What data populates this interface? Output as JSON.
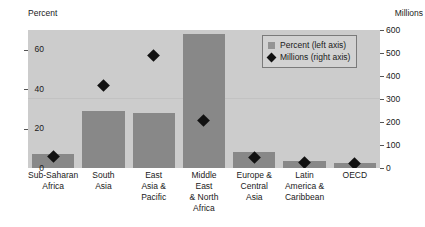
{
  "chart_data": {
    "type": "bar",
    "title": "",
    "subtitle": "",
    "categories": [
      "Sub-Saharan Africa",
      "South Asia",
      "East Asia & Pacific",
      "Middle East & North Africa",
      "Europe & Central Asia",
      "Latin America & Caribbean",
      "OECD"
    ],
    "category_lines": [
      [
        "Sub-Saharan",
        "Africa"
      ],
      [
        "South",
        "Asia"
      ],
      [
        "East",
        "Asia &",
        "Pacific"
      ],
      [
        "Middle",
        "East",
        "& North",
        "Africa"
      ],
      [
        "Europe &",
        "Central",
        "Asia"
      ],
      [
        "Latin",
        "America &",
        "Caribbean"
      ],
      [
        "OECD"
      ]
    ],
    "series": [
      {
        "name": "Percent (left axis)",
        "axis": "left",
        "marker": "bar",
        "color": "#888888",
        "values": [
          7,
          29,
          28,
          68,
          8,
          3.5,
          2.5
        ]
      },
      {
        "name": "Millions (right axis)",
        "axis": "right",
        "marker": "diamond",
        "color": "#111111",
        "values": [
          50,
          360,
          490,
          205,
          45,
          25,
          20
        ]
      }
    ],
    "xlabel": "",
    "ylabel": "Percent",
    "y2label": "Millions",
    "ylim": [
      0,
      70
    ],
    "y2lim": [
      0,
      600
    ],
    "yticks": [
      0,
      20,
      40,
      60
    ],
    "y2ticks": [
      0,
      100,
      200,
      300,
      400,
      500,
      600
    ],
    "ytick_labels": [
      "0",
      "20",
      "40",
      "60"
    ],
    "y2tick_labels": [
      "0",
      "100",
      "200",
      "300",
      "400",
      "500",
      "600"
    ],
    "grid": "single-faint-line-at-300",
    "legend_position": "top-right-inside",
    "plot_background": "#cccccc",
    "bar_color": "#888888",
    "marker_color": "#111111"
  },
  "axes": {
    "left_caption": "Percent",
    "right_caption": "Millions"
  },
  "legend": {
    "entries": [
      {
        "label": "Percent (left axis)",
        "marker": "square"
      },
      {
        "label": "Millions (right axis)",
        "marker": "diamond"
      }
    ]
  }
}
